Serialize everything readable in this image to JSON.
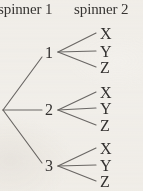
{
  "diagram": {
    "type": "probability-tree-diagram",
    "background_color": "#f4f2ee",
    "ink_color": "#333130",
    "line_color": "#6b6866",
    "headers": [
      {
        "id": "spinner-1",
        "label": "spinner 1",
        "x": -2,
        "y": 0,
        "truncated": false
      },
      {
        "id": "spinner-2",
        "label": "spinner 2",
        "x": 74,
        "y": 0,
        "truncated": true
      }
    ],
    "root": {
      "x": 3,
      "y": 110
    },
    "stage1": {
      "label": "spinner 1",
      "nodes": [
        {
          "id": "node-1",
          "label": "1",
          "x": 44,
          "y": 45,
          "branch_end_x": 42,
          "branch_end_y": 57,
          "fan_x": 58,
          "fan_y": 52
        },
        {
          "id": "node-2",
          "label": "2",
          "x": 44,
          "y": 102,
          "branch_end_x": 42,
          "branch_end_y": 110,
          "fan_x": 58,
          "fan_y": 110
        },
        {
          "id": "node-3",
          "label": "3",
          "x": 44,
          "y": 158,
          "branch_end_x": 42,
          "branch_end_y": 163,
          "fan_x": 58,
          "fan_y": 166
        }
      ]
    },
    "stage2": {
      "label": "spinner 2",
      "leaf_labels": [
        "X",
        "Y",
        "Z"
      ],
      "leaf_x": 100,
      "branch_end_x": 96,
      "groups": [
        {
          "parent": "1",
          "leaves": [
            {
              "label": "X",
              "y": 26,
              "end_y": 33
            },
            {
              "label": "Y",
              "y": 44,
              "end_y": 51
            },
            {
              "label": "Z",
              "y": 60,
              "end_y": 67
            }
          ]
        },
        {
          "parent": "2",
          "leaves": [
            {
              "label": "X",
              "y": 85,
              "end_y": 92
            },
            {
              "label": "Y",
              "y": 101,
              "end_y": 108
            },
            {
              "label": "Z",
              "y": 118,
              "end_y": 125
            }
          ]
        },
        {
          "parent": "3",
          "leaves": [
            {
              "label": "X",
              "y": 141,
              "end_y": 148
            },
            {
              "label": "Y",
              "y": 158,
              "end_y": 165
            },
            {
              "label": "Z",
              "y": 174,
              "end_y": 181
            }
          ]
        }
      ]
    }
  }
}
